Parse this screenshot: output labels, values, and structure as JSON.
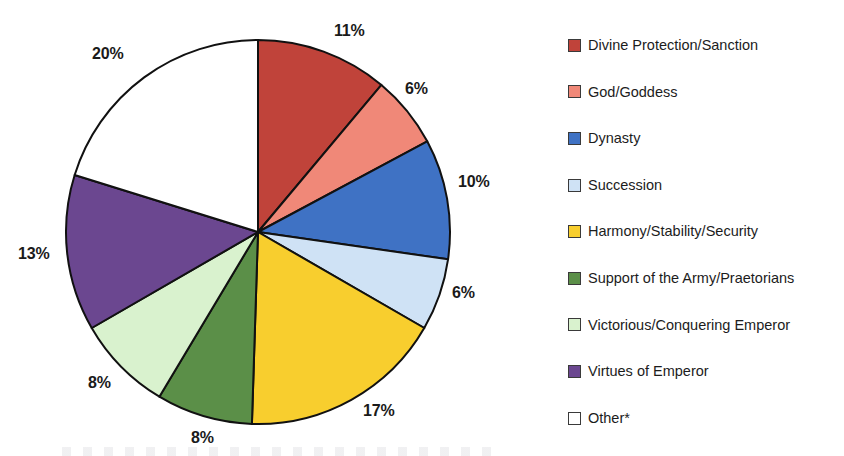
{
  "chart_data": {
    "type": "pie",
    "title": "",
    "start_angle": 0,
    "direction": "clockwise",
    "legend_position": "right",
    "grid": false,
    "categories": [
      "Divine Protection/Sanction",
      "God/Goddess",
      "Dynasty",
      "Succession",
      "Harmony/Stability/Security",
      "Support of the Army/Praetorians",
      "Victorious/Conquering Emperor",
      "Virtues of Emperor",
      "Other*"
    ],
    "values": [
      11,
      6,
      10,
      6,
      17,
      8,
      8,
      13,
      20
    ],
    "value_labels": [
      "11%",
      "6%",
      "10%",
      "6%",
      "17%",
      "8%",
      "8%",
      "13%",
      "20%"
    ],
    "colors": [
      "#C0433A",
      "#F08878",
      "#3F72C4",
      "#CFE2F5",
      "#F8CE2E",
      "#5B8F48",
      "#D9F2CE",
      "#6B4790",
      "#FFFFFF"
    ],
    "slice_border_color": "#111111",
    "label_color": "#1a1a1a"
  },
  "pie": {
    "center_x": 258,
    "center_y": 232,
    "radius": 192,
    "slices": [
      {
        "name": "Divine Protection/Sanction",
        "label": "11%",
        "color": "#C0433A",
        "value": 11,
        "label_x": 334,
        "label_y": 22
      },
      {
        "name": "God/Goddess",
        "label": "6%",
        "color": "#F08878",
        "value": 6,
        "label_x": 405,
        "label_y": 80
      },
      {
        "name": "Dynasty",
        "label": "10%",
        "color": "#3F72C4",
        "value": 10,
        "label_x": 458,
        "label_y": 173
      },
      {
        "name": "Succession",
        "label": "6%",
        "color": "#CFE2F5",
        "value": 6,
        "label_x": 452,
        "label_y": 284
      },
      {
        "name": "Harmony/Stability/Security",
        "label": "17%",
        "color": "#F8CE2E",
        "value": 17,
        "label_x": 363,
        "label_y": 402
      },
      {
        "name": "Support of the Army/Praetorians",
        "label": "8%",
        "color": "#5B8F48",
        "value": 8,
        "label_x": 191,
        "label_y": 429
      },
      {
        "name": "Victorious/Conquering Emperor",
        "label": "8%",
        "color": "#D9F2CE",
        "value": 8,
        "label_x": 88,
        "label_y": 374
      },
      {
        "name": "Virtues of Emperor",
        "label": "13%",
        "color": "#6B4790",
        "value": 13,
        "label_x": 18,
        "label_y": 245
      },
      {
        "name": "Other*",
        "label": "20%",
        "color": "#FFFFFF",
        "value": 20,
        "label_x": 92,
        "label_y": 45
      }
    ]
  },
  "legend": {
    "items": [
      {
        "label": "Divine Protection/Sanction",
        "color": "#C0433A"
      },
      {
        "label": "God/Goddess",
        "color": "#F08878"
      },
      {
        "label": "Dynasty",
        "color": "#3F72C4"
      },
      {
        "label": "Succession",
        "color": "#CFE2F5"
      },
      {
        "label": "Harmony/Stability/Security",
        "color": "#F8CE2E"
      },
      {
        "label": "Support of the Army/Praetorians",
        "color": "#5B8F48"
      },
      {
        "label": "Victorious/Conquering Emperor",
        "color": "#D9F2CE"
      },
      {
        "label": "Virtues of Emperor",
        "color": "#6B4790"
      },
      {
        "label": "Other*",
        "color": "#FFFFFF"
      }
    ]
  }
}
